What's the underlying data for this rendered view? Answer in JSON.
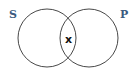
{
  "diagram": {
    "type": "venn",
    "sets": [
      {
        "label": "S",
        "label_color": "#3a5a80"
      },
      {
        "label": "P",
        "label_color": "#3a5a80"
      }
    ],
    "intersection_mark": "x",
    "line_color": "#333333"
  }
}
